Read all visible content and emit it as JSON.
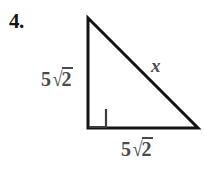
{
  "figure": {
    "problem_number": "4.",
    "background_color": "#ffffff",
    "stroke_color": "#141414",
    "label_color": "#4a4a4a",
    "shape": "right-triangle",
    "labels": {
      "left_leg": {
        "text": "5√2",
        "coefficient": "5",
        "surd": "√",
        "radicand": "2"
      },
      "bottom_leg": {
        "text": "5√2",
        "coefficient": "5",
        "surd": "√",
        "radicand": "2"
      },
      "hypotenuse": {
        "text": "x"
      }
    },
    "geometry": {
      "top_vertex": [
        88,
        18
      ],
      "right_angle_vertex": [
        88,
        128
      ],
      "right_vertex": [
        198,
        128
      ],
      "right_angle_marker_size": 18,
      "stroke_width": 3
    }
  }
}
